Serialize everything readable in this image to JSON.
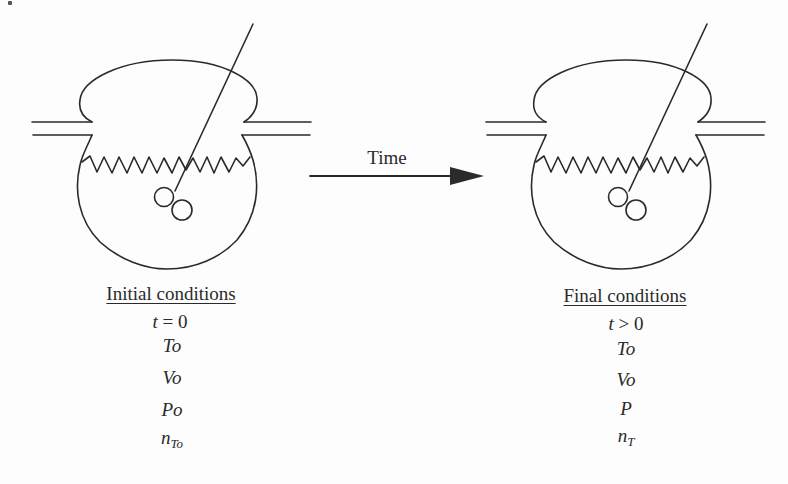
{
  "figure": {
    "arrow": {
      "label": "Time"
    },
    "initial": {
      "heading": "Initial conditions",
      "variables": [
        {
          "main": "t",
          "rest": " = 0",
          "sub": ""
        },
        {
          "main": "To",
          "rest": "",
          "sub": ""
        },
        {
          "main": "Vo",
          "rest": "",
          "sub": ""
        },
        {
          "main": "Po",
          "rest": "",
          "sub": ""
        },
        {
          "main": "n",
          "rest": "",
          "sub": "To"
        }
      ]
    },
    "final": {
      "heading": "Final conditions",
      "variables": [
        {
          "main": "t",
          "rest": " > 0",
          "sub": ""
        },
        {
          "main": "To",
          "rest": "",
          "sub": ""
        },
        {
          "main": "Vo",
          "rest": "",
          "sub": ""
        },
        {
          "main": "P",
          "rest": "",
          "sub": ""
        },
        {
          "main": "n",
          "rest": "",
          "sub": "T"
        }
      ]
    },
    "colors": {
      "line": "#2a2a2a",
      "background": "#fdfdfd"
    }
  }
}
